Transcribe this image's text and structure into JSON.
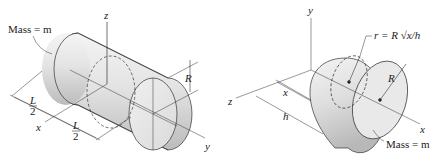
{
  "figure_left": {
    "title": "cylinder",
    "mass_label": "Mass = m",
    "axis_z": "z",
    "axis_y": "y",
    "axis_x": "x",
    "radius": "R",
    "half_length_num_1": "L",
    "half_length_den_1": "2",
    "half_length_num_2": "L",
    "half_length_den_2": "2"
  },
  "figure_right": {
    "title": "paraboloid",
    "mass_label": "Mass = m",
    "axis_y": "y",
    "axis_z": "z",
    "axis_x": "x",
    "radius": "R",
    "dim_x": "x",
    "dim_h": "h",
    "profile_eq": "r = R √x/h"
  },
  "colors": {
    "line": "#333333",
    "fill_light": "#f2f2f2",
    "fill_dark": "#bdbdbd"
  }
}
